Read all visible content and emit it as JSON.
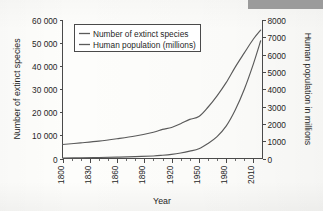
{
  "artifacts": {
    "redaction_bar_color": "#9b9b9b"
  },
  "chart_data": {
    "type": "line",
    "title": "",
    "xlabel": "Year",
    "ylabel": "Number of extinct species",
    "ylabel_right": "Human population in millions",
    "xlim": [
      1800,
      2020
    ],
    "ylim": [
      0,
      60000
    ],
    "ylim_right": [
      0,
      8000
    ],
    "grid": false,
    "legend_position": "upper-left-inside",
    "x_ticks": [
      1800,
      1830,
      1860,
      1890,
      1920,
      1950,
      1980,
      2010
    ],
    "x_tick_labels": [
      "1800",
      "1830",
      "1860",
      "1890",
      "1920",
      "1950",
      "1980",
      "2010"
    ],
    "x_minor_tick_step": 10,
    "y_ticks_left": [
      0,
      10000,
      20000,
      30000,
      40000,
      50000,
      60000
    ],
    "y_tick_labels_left": [
      "0",
      "10 000",
      "20 000",
      "30 000",
      "40 000",
      "50 000",
      "60 000"
    ],
    "y_ticks_right": [
      0,
      1000,
      2000,
      3000,
      4000,
      5000,
      6000,
      7000,
      8000
    ],
    "y_tick_labels_right": [
      "0",
      "1000",
      "2000",
      "3000",
      "4000",
      "5000",
      "6000",
      "7000",
      "8000"
    ],
    "line_color": "#5a5a5a",
    "series": [
      {
        "name": "Number of extinct species",
        "axis": "left",
        "units": "species",
        "x": [
          1800,
          1820,
          1840,
          1860,
          1880,
          1900,
          1910,
          1920,
          1930,
          1940,
          1950,
          1960,
          1970,
          1980,
          1990,
          2000,
          2010,
          2018
        ],
        "values": [
          200,
          300,
          450,
          600,
          800,
          1100,
          1400,
          1800,
          2400,
          3200,
          4200,
          6500,
          9500,
          14000,
          21000,
          30000,
          41000,
          51000
        ]
      },
      {
        "name": "Human population (millions)",
        "axis": "right",
        "units": "millions",
        "x": [
          1800,
          1820,
          1840,
          1860,
          1880,
          1900,
          1910,
          1920,
          1930,
          1940,
          1950,
          1960,
          1970,
          1980,
          1990,
          2000,
          2010,
          2018
        ],
        "values": [
          810,
          900,
          1000,
          1140,
          1300,
          1520,
          1680,
          1790,
          2010,
          2260,
          2420,
          2960,
          3620,
          4380,
          5280,
          6100,
          6900,
          7420
        ]
      }
    ]
  },
  "legend": {
    "entries": [
      {
        "label": "Number of extinct species"
      },
      {
        "label": "Human population (millions)"
      }
    ]
  }
}
